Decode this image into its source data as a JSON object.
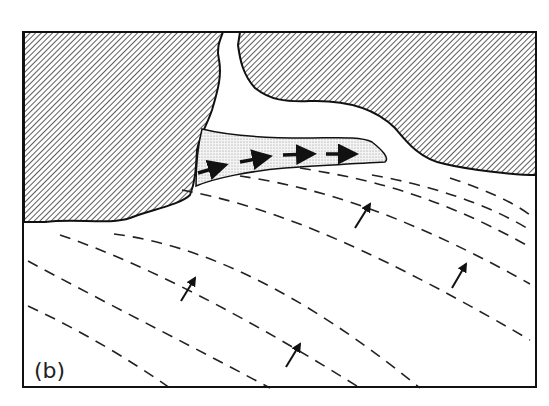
{
  "figure": {
    "panel_label": "(b)",
    "elements": {
      "land": "hatched-land",
      "spit": "stippled-spit",
      "wave_crests": "dashed-wave-crest-lines",
      "wave_direction_arrows": 4,
      "longshore_drift_arrows": 4
    },
    "colors": {
      "ink": "#1a1a1a",
      "background": "#ffffff",
      "stipple": "#d8d8d8"
    }
  }
}
